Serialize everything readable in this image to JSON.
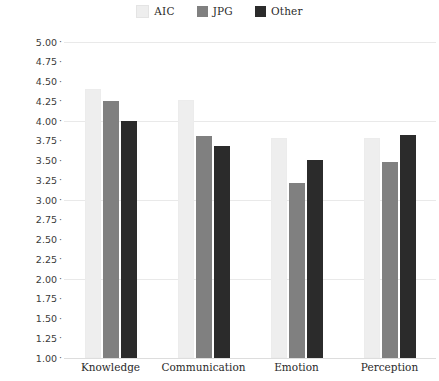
{
  "chart_data": {
    "type": "bar",
    "title": "",
    "subtitle": "",
    "xlabel": "",
    "ylabel": "",
    "categories": [
      "Knowledge",
      "Communication",
      "Emotion",
      "Perception"
    ],
    "series": [
      {
        "name": "AIC",
        "color": "#eeeeee",
        "values": [
          4.4,
          4.27,
          3.79,
          3.79
        ]
      },
      {
        "name": "JPG",
        "color": "#808080",
        "values": [
          4.25,
          3.81,
          3.21,
          3.48
        ]
      },
      {
        "name": "Other",
        "color": "#2b2b2b",
        "values": [
          4.0,
          3.68,
          3.51,
          3.82
        ]
      }
    ],
    "ylim": [
      1.0,
      5.0
    ],
    "ytick_step": 0.25,
    "ytick_labels": [
      "5.00",
      "4.75",
      "4.50",
      "4.25",
      "4.00",
      "3.75",
      "3.50",
      "3.25",
      "3.00",
      "2.75",
      "2.50",
      "2.25",
      "2.00",
      "1.75",
      "1.50",
      "1.25",
      "1.00"
    ],
    "ytick_values": [
      5.0,
      4.75,
      4.5,
      4.25,
      4.0,
      3.75,
      3.5,
      3.25,
      3.0,
      2.75,
      2.5,
      2.25,
      2.0,
      1.75,
      1.5,
      1.25,
      1.0
    ],
    "major_gridlines": [
      5.0,
      4.0,
      3.0,
      2.0,
      1.0
    ],
    "grid": true,
    "grid_color": "#e9e9e9",
    "legend_position": "top-center",
    "tick_marker": "·",
    "annotations": []
  }
}
